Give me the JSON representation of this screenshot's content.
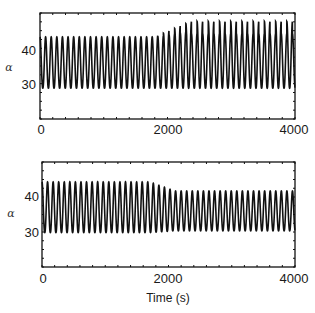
{
  "chart_data": [
    {
      "type": "line",
      "title": "",
      "xlabel": "",
      "ylabel": "α",
      "xlim": [
        0,
        4000
      ],
      "ylim": [
        20,
        51
      ],
      "xticks": [
        0,
        2000,
        4000
      ],
      "xtick_labels": [
        "0",
        "2000",
        "4000"
      ],
      "yticks": [
        30,
        40
      ],
      "ytick_labels": [
        "30",
        "40"
      ],
      "grid": false,
      "legend": null,
      "series": [
        {
          "name": "alpha_top",
          "description": "Sustained oscillation of ~88 s period. Before ~1800 s: min ≈ 29, max ≈ 44. After ~1800 s amplitude grows; peaks alternate between ≈ 45 and ≈ 48-49 while minima stay ≈ 29.",
          "period_s": 88,
          "segments": [
            {
              "t_start": 0,
              "t_end": 1800,
              "min": 29,
              "max": 44
            },
            {
              "t_start": 1800,
              "t_end": 2300,
              "min": 29,
              "max_from": 44,
              "max_to": 48
            },
            {
              "t_start": 2300,
              "t_end": 4000,
              "min": 29,
              "max_alternating": [
                45,
                48.5
              ]
            }
          ]
        }
      ],
      "color": "#111111"
    },
    {
      "type": "line",
      "title": "",
      "xlabel": "Time (s)",
      "ylabel": "α",
      "xlim": [
        0,
        4000
      ],
      "ylim": [
        20,
        49
      ],
      "xticks": [
        0,
        2000,
        4000
      ],
      "xtick_labels": [
        "0",
        "2000",
        "4000"
      ],
      "yticks": [
        30,
        40
      ],
      "ytick_labels": [
        "30",
        "40"
      ],
      "grid": false,
      "legend": null,
      "series": [
        {
          "name": "alpha_bottom",
          "description": "Sustained oscillation of ~88 s period. Before ~1800 s: min ≈ 29.5, max ≈ 43.5. After ~1800 s amplitude decreases slightly to min ≈ 30, max ≈ 41.",
          "period_s": 88,
          "segments": [
            {
              "t_start": 0,
              "t_end": 1700,
              "min": 29.5,
              "max": 43.5
            },
            {
              "t_start": 1700,
              "t_end": 2100,
              "min_from": 29.5,
              "min_to": 30,
              "max_from": 43.5,
              "max_to": 41
            },
            {
              "t_start": 2100,
              "t_end": 4000,
              "min": 30,
              "max": 41
            }
          ]
        }
      ],
      "color": "#111111"
    }
  ],
  "top": {
    "ylabel": "α",
    "yticks": [
      "40",
      "30"
    ],
    "xticks": [
      "0",
      "2000",
      "4000"
    ]
  },
  "bottom": {
    "ylabel": "α",
    "yticks": [
      "40",
      "30"
    ],
    "xticks": [
      "0",
      "2000",
      "4000"
    ],
    "xlabel": "Time (s)"
  }
}
